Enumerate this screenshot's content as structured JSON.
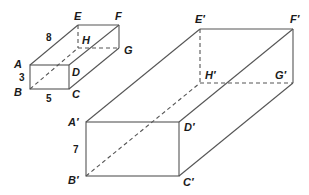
{
  "diagram": {
    "type": "similar-rectangular-prisms",
    "small_prism": {
      "vertices": {
        "A": "A",
        "B": "B",
        "C": "C",
        "D": "D",
        "E": "E",
        "F": "F",
        "G": "G",
        "H": "H"
      },
      "dimensions": {
        "depth": "8",
        "height": "3",
        "width": "5"
      }
    },
    "large_prism": {
      "vertices": {
        "A": "A′",
        "B": "B′",
        "C": "C′",
        "D": "D′",
        "E": "E′",
        "F": "F′",
        "G": "G′",
        "H": "H′"
      },
      "dimensions": {
        "height": "7"
      }
    }
  }
}
